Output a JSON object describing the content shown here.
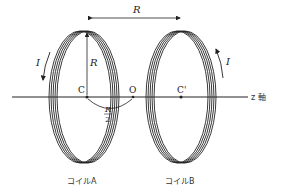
{
  "diagram": {
    "labels": {
      "distance_R": "R",
      "radius_R": "R",
      "current_left": "I",
      "current_right": "I",
      "center_A": "C",
      "midpoint": "O",
      "center_B": "C'",
      "half_R_num": "R",
      "half_R_den": "2",
      "axis": "z 軸",
      "coil_A": "コイルA",
      "coil_B": "コイルB"
    },
    "colors": {
      "line": "#222222",
      "background": "#ffffff"
    }
  }
}
